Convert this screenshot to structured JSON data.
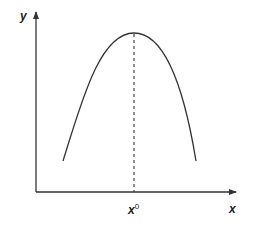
{
  "figure": {
    "axes": {
      "x_label": "x",
      "y_label": "y"
    },
    "peak_marker": {
      "label_base": "x",
      "label_superscript": "0"
    },
    "colors": {
      "stroke": "#333333",
      "background": "#ffffff"
    }
  }
}
